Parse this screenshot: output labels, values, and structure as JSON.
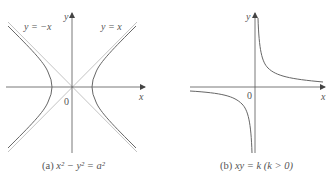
{
  "figure": {
    "panel_a": {
      "caption_prefix": "(a)",
      "caption_equation": "x² − y² = a²",
      "axis_x_label": "x",
      "axis_y_label": "y",
      "origin_label": "0",
      "asymptote_left_label": "y = −x",
      "asymptote_right_label": "y = x",
      "curve": "hyperbola x^2 - y^2 = a^2 with asymptotes y = x and y = -x"
    },
    "panel_b": {
      "caption_prefix": "(b)",
      "caption_equation": "xy = k  (k > 0)",
      "axis_x_label": "x",
      "axis_y_label": "y",
      "origin_label": "0",
      "curve": "rectangular hyperbola xy = k, k > 0"
    },
    "colors": {
      "axis": "#555555",
      "curve": "#666666",
      "asymptote": "#bbbbbb",
      "text": "#555555"
    }
  }
}
